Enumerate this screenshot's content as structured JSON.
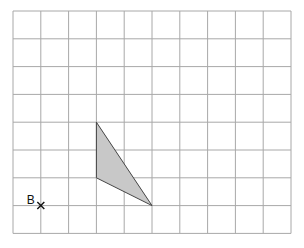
{
  "diagram": {
    "type": "grid-diagram",
    "grid": {
      "columns": 10,
      "rows": 8
    },
    "shape": {
      "name": "triangle",
      "vertices_grid": [
        [
          3,
          4
        ],
        [
          3,
          6
        ],
        [
          5,
          7
        ]
      ],
      "fill": "#c8c8c8",
      "stroke": "#444444"
    },
    "point": {
      "label": "B",
      "marker": "cross",
      "grid_position": [
        1,
        7
      ]
    }
  }
}
